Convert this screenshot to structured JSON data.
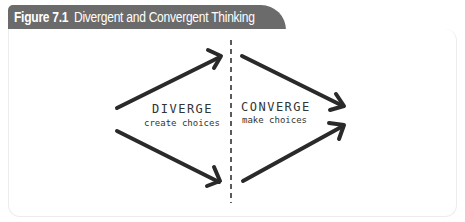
{
  "figure": {
    "label": "Figure 7.1",
    "title": "Divergent and Convergent Thinking",
    "header_color": "#6b6b6b"
  },
  "diagram": {
    "left": {
      "title": "DIVERGE",
      "subtitle": "create choices"
    },
    "right": {
      "title": "CONVERGE",
      "subtitle": "make choices"
    },
    "arrow_color": "#2a2a2a",
    "divider": "dashed-vertical-line"
  }
}
